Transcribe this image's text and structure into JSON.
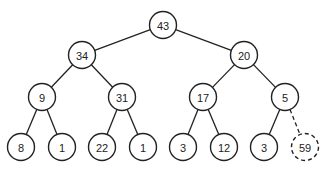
{
  "diagram": {
    "type": "binary-heap-tree",
    "node_radius": 13.5,
    "nodes": [
      {
        "id": "n0",
        "label": "43",
        "x": 163,
        "y": 25
      },
      {
        "id": "n1",
        "label": "34",
        "x": 82,
        "y": 55
      },
      {
        "id": "n2",
        "label": "20",
        "x": 244,
        "y": 55
      },
      {
        "id": "n3",
        "label": "9",
        "x": 42,
        "y": 97
      },
      {
        "id": "n4",
        "label": "31",
        "x": 122,
        "y": 97
      },
      {
        "id": "n5",
        "label": "17",
        "x": 203,
        "y": 97
      },
      {
        "id": "n6",
        "label": "5",
        "x": 285,
        "y": 97
      },
      {
        "id": "n7",
        "label": "8",
        "x": 21,
        "y": 147
      },
      {
        "id": "n8",
        "label": "1",
        "x": 62,
        "y": 147
      },
      {
        "id": "n9",
        "label": "22",
        "x": 102,
        "y": 147
      },
      {
        "id": "n10",
        "label": "1",
        "x": 143,
        "y": 147
      },
      {
        "id": "n11",
        "label": "3",
        "x": 183,
        "y": 147
      },
      {
        "id": "n12",
        "label": "12",
        "x": 224,
        "y": 147
      },
      {
        "id": "n13",
        "label": "3",
        "x": 264,
        "y": 147
      },
      {
        "id": "n14",
        "label": "59",
        "x": 305,
        "y": 147,
        "style": "dashed"
      }
    ],
    "edges": [
      {
        "from": "n0",
        "to": "n1"
      },
      {
        "from": "n0",
        "to": "n2"
      },
      {
        "from": "n1",
        "to": "n3"
      },
      {
        "from": "n1",
        "to": "n4"
      },
      {
        "from": "n2",
        "to": "n5"
      },
      {
        "from": "n2",
        "to": "n6"
      },
      {
        "from": "n3",
        "to": "n7"
      },
      {
        "from": "n3",
        "to": "n8"
      },
      {
        "from": "n4",
        "to": "n9"
      },
      {
        "from": "n4",
        "to": "n10"
      },
      {
        "from": "n5",
        "to": "n11"
      },
      {
        "from": "n5",
        "to": "n12"
      },
      {
        "from": "n6",
        "to": "n13"
      },
      {
        "from": "n6",
        "to": "n14",
        "style": "dashed"
      }
    ]
  }
}
